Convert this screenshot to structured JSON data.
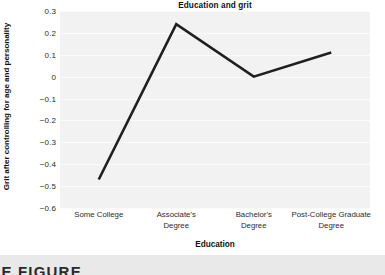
{
  "figure": {
    "title": "Education and grit",
    "x_axis_title": "Education",
    "y_axis_title": "Grit after controlling for age and personality",
    "caption_partial": "RIE FIGURE"
  },
  "colors": {
    "line": "#1f1f1f",
    "plot_background": "#f2f2f2",
    "gridline": "#fbfbfb",
    "text": "#2b2b2b",
    "strip_background": "#e9e9e9"
  },
  "chart_data": {
    "type": "line",
    "title": "Education and grit",
    "xlabel": "Education",
    "ylabel": "Grit after controlling for age and personality",
    "categories": [
      "Some College",
      "Associate's Degree",
      "Bachelor's Degree",
      "Post-College Graduate Degree"
    ],
    "values": [
      -0.47,
      0.24,
      0.0,
      0.11
    ],
    "ylim": [
      -0.6,
      0.3
    ],
    "yticks": [
      0.3,
      0.2,
      0.1,
      0,
      -0.1,
      -0.2,
      -0.3,
      -0.4,
      -0.5,
      -0.6
    ],
    "ytick_labels": [
      "0.3",
      "0.2",
      "0.1",
      "0",
      "−0.1",
      "−0.2",
      "−0.3",
      "−0.4",
      "−0.5",
      "−0.6"
    ],
    "grid": true,
    "legend": null,
    "series": [
      {
        "name": "Grit after controlling for age and personality",
        "values": [
          -0.47,
          0.24,
          0.0,
          0.11
        ]
      }
    ]
  },
  "x_tick_lines": [
    [
      "Some College"
    ],
    [
      "Associate's",
      "Degree"
    ],
    [
      "Bachelor's",
      "Degree"
    ],
    [
      "Post-College Graduate",
      "Degree"
    ]
  ]
}
